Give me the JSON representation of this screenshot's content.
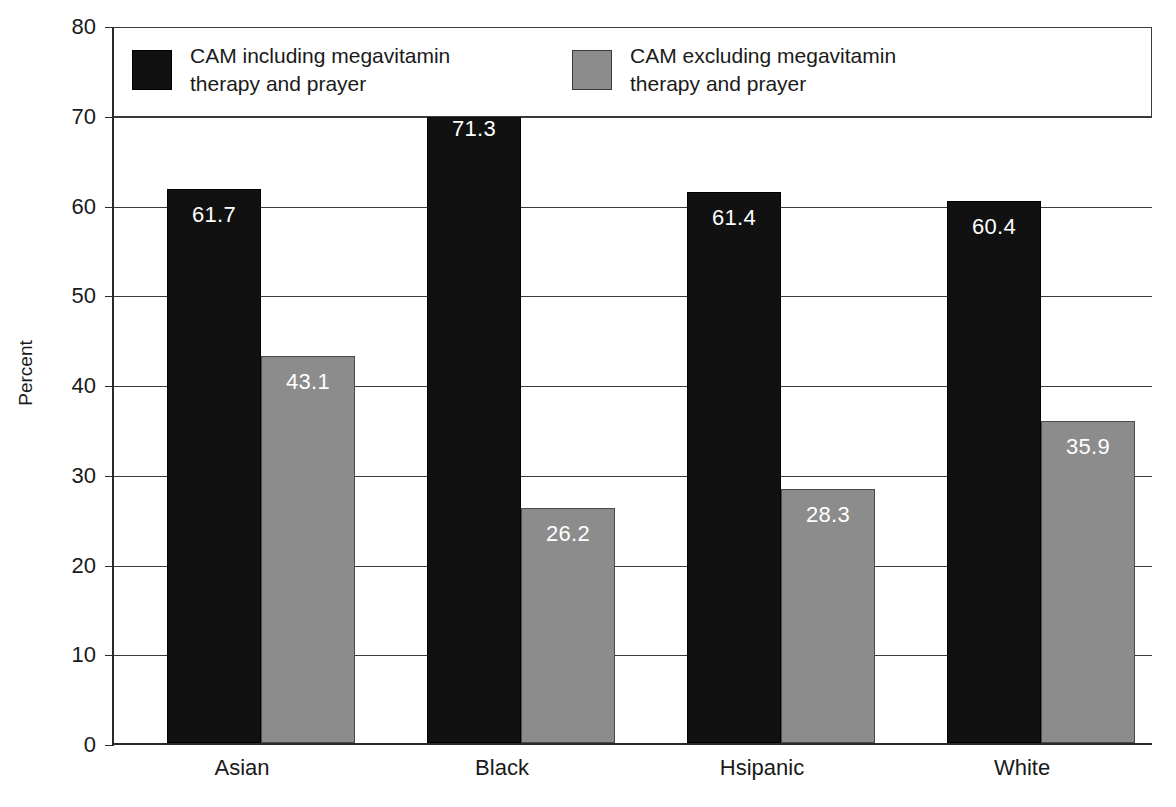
{
  "chart_data": {
    "type": "bar",
    "title": "",
    "xlabel": "",
    "ylabel": "Percent",
    "ylim": [
      0,
      80
    ],
    "ytick_step": 10,
    "yticks": [
      "80",
      "70",
      "60",
      "50",
      "40",
      "30",
      "20",
      "10",
      "0"
    ],
    "grid": true,
    "legend_position": "inside-top",
    "categories": [
      "Asian",
      "Black",
      "Hsipanic",
      "White"
    ],
    "series": [
      {
        "name": "CAM including megavitamin\ntherapy and prayer",
        "color": "#111111",
        "values": [
          61.7,
          71.3,
          61.4,
          60.4
        ],
        "labels": [
          "61.7",
          "71.3",
          "61.4",
          "60.4"
        ]
      },
      {
        "name": "CAM excluding megavitamin\ntherapy and prayer",
        "color": "#8c8c8c",
        "values": [
          43.1,
          26.2,
          28.3,
          35.9
        ],
        "labels": [
          "43.1",
          "26.2",
          "28.3",
          "35.9"
        ]
      }
    ]
  },
  "legend": {
    "entries": [
      {
        "label": "CAM including megavitamin\ntherapy and prayer"
      },
      {
        "label": "CAM excluding megavitamin\ntherapy and prayer"
      }
    ]
  },
  "axes": {
    "y_title": "Percent",
    "y_ticks": [
      "80",
      "70",
      "60",
      "50",
      "40",
      "30",
      "20",
      "10",
      "0"
    ],
    "x_ticks": [
      "Asian",
      "Black",
      "Hsipanic",
      "White"
    ]
  }
}
